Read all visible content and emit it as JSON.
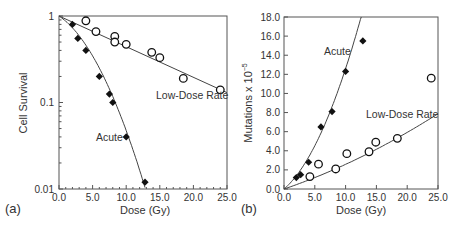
{
  "chart_data": [
    {
      "type": "scatter",
      "panel_label": "(a)",
      "title": "",
      "xlabel": "Dose (Gy)",
      "ylabel": "Cell Survival",
      "xlim": [
        0,
        25
      ],
      "ylim": [
        0.01,
        1
      ],
      "yscale": "log",
      "x_ticks": [
        "0.0",
        "5.0",
        "10.0",
        "15.0",
        "20.0",
        "25.0"
      ],
      "y_ticks": [
        "1",
        "0.1",
        "0.01"
      ],
      "grid": false,
      "legend": "none (inline annotations)",
      "series": [
        {
          "name": "Acute",
          "marker": "filled-diamond",
          "x": [
            2.0,
            2.8,
            4.0,
            6.0,
            7.5,
            8.0,
            10.0,
            12.8
          ],
          "y": [
            0.8,
            0.55,
            0.4,
            0.2,
            0.125,
            0.1,
            0.04,
            0.012
          ],
          "fit": "linear-quadratic curve from (0,1) to (12.8,0.012)"
        },
        {
          "name": "Low-Dose Rate",
          "marker": "open-circle",
          "x": [
            4.0,
            5.5,
            8.3,
            8.3,
            10.0,
            13.8,
            15.0,
            18.5,
            24.0
          ],
          "y": [
            0.88,
            0.66,
            0.58,
            0.5,
            0.47,
            0.38,
            0.33,
            0.19,
            0.14
          ],
          "fit": "exponential line from (0,1) to (25,0.13)"
        }
      ],
      "annotations": [
        "Acute",
        "Low-Dose Rate"
      ]
    },
    {
      "type": "scatter",
      "panel_label": "(b)",
      "title": "",
      "xlabel": "Dose (Gy)",
      "ylabel": "Mutations x 10^-5",
      "xlim": [
        0,
        25
      ],
      "ylim": [
        0,
        18
      ],
      "x_ticks": [
        "0.0",
        "5.0",
        "10.0",
        "15.0",
        "20.0",
        "25.0"
      ],
      "y_ticks": [
        "0.0",
        "2.0",
        "4.0",
        "6.0",
        "8.0",
        "10.0",
        "12.0",
        "14.0",
        "16.0",
        "18.0"
      ],
      "grid": false,
      "legend": "none (inline annotations)",
      "series": [
        {
          "name": "Acute",
          "marker": "filled-diamond",
          "x": [
            2.0,
            2.7,
            4.0,
            6.0,
            7.8,
            10.0,
            12.8
          ],
          "y": [
            1.2,
            1.5,
            2.8,
            6.5,
            8.1,
            12.3,
            15.5
          ],
          "fit": "upward-curving fit from (0,0) to (12.5,18)"
        },
        {
          "name": "Low-Dose Rate",
          "marker": "open-circle",
          "x": [
            4.2,
            5.6,
            8.4,
            10.2,
            13.8,
            14.9,
            18.4,
            23.9
          ],
          "y": [
            1.3,
            2.6,
            2.1,
            3.7,
            3.9,
            4.9,
            5.3,
            11.6
          ],
          "fit": "slightly curving fit from (0,0) to (25,7.9)"
        }
      ],
      "annotations": [
        "Acute",
        "Low-Dose Rate"
      ]
    }
  ],
  "labels": {
    "a": {
      "panel": "(a)",
      "xlabel": "Dose (Gy)",
      "ylabel": "Cell Survival",
      "acute": "Acute",
      "ldr": "Low-Dose Rate",
      "yticks": [
        "1",
        "0.1",
        "0.01"
      ],
      "xticks": [
        "0.0",
        "5.0",
        "10.0",
        "15.0",
        "20.0",
        "25.0"
      ]
    },
    "b": {
      "panel": "(b)",
      "xlabel": "Dose (Gy)",
      "ylabel_main": "Mutations x 10",
      "ylabel_exp": "−5",
      "acute": "Acute",
      "ldr": "Low-Dose Rate",
      "yticks": [
        "0.0",
        "2.0",
        "4.0",
        "6.0",
        "8.0",
        "10.0",
        "12.0",
        "14.0",
        "16.0",
        "18.0"
      ],
      "xticks": [
        "0.0",
        "5.0",
        "10.0",
        "15.0",
        "20.0",
        "25.0"
      ]
    }
  },
  "colors": {
    "axis": "#555555",
    "line": "#444444",
    "marker": "#111111",
    "text": "#333333"
  }
}
